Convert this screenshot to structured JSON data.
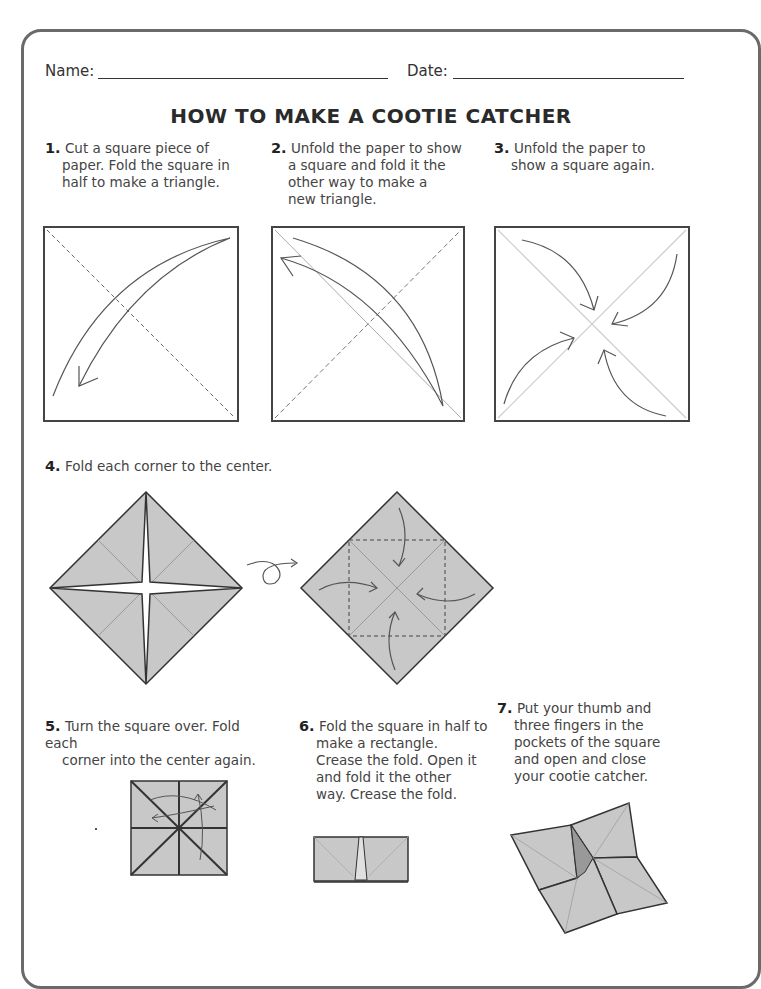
{
  "header": {
    "name_label": "Name:",
    "date_label": "Date:"
  },
  "title": "HOW TO MAKE A COOTIE CATCHER",
  "steps": [
    {
      "number": "1.",
      "first": "Cut a square piece of",
      "rest": [
        "paper. Fold the square in",
        "half to make a triangle."
      ]
    },
    {
      "number": "2.",
      "first": "Unfold the paper to show",
      "rest": [
        "a square and fold it the",
        "other way to make a",
        "new triangle."
      ]
    },
    {
      "number": "3.",
      "first": "Unfold the paper to",
      "rest": [
        "show a square again."
      ]
    },
    {
      "number": "4.",
      "first": "Fold each corner to the center.",
      "rest": []
    },
    {
      "number": "5.",
      "first": "Turn the square over. Fold each",
      "rest": [
        "corner into the center again."
      ]
    },
    {
      "number": "6.",
      "first": "Fold the square in half to",
      "rest": [
        "make a rectangle.",
        "Crease the fold. Open it",
        "and fold it the other",
        "way. Crease the fold."
      ]
    },
    {
      "number": "7.",
      "first": "Put your thumb and",
      "rest": [
        "three fingers in the",
        "pockets of the square",
        "and open and close",
        "your cootie catcher."
      ]
    }
  ],
  "colors": {
    "paper_fill": "#c8c8c8",
    "line": "#333333",
    "frame": "#6a6a6a"
  }
}
